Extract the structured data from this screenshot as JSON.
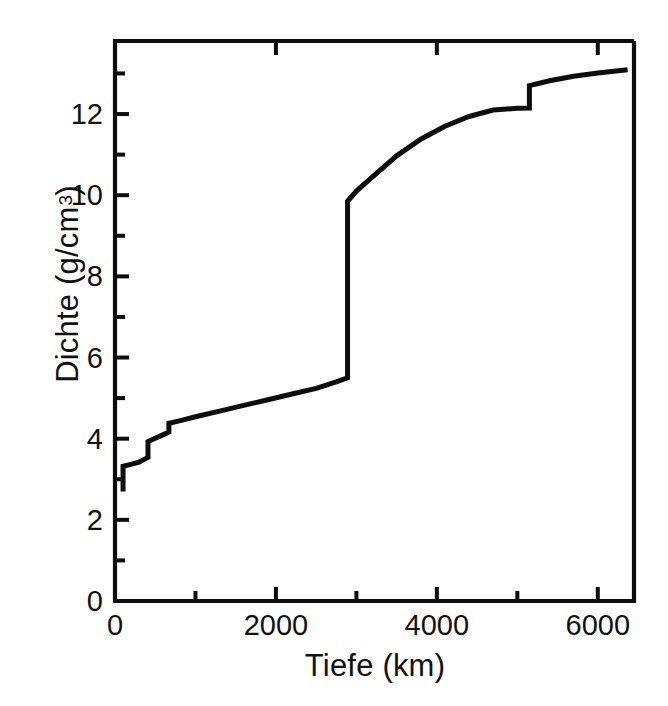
{
  "figure": {
    "title": "",
    "xlabel": "Tiefe (km)",
    "ylabel_main": "Dichte (g/cm",
    "ylabel_exponent": "3",
    "ylabel_close": ")",
    "line_color": "#0d0d0d",
    "axis_color": "#0d0d0d",
    "background": "#ffffff"
  },
  "ticks": {
    "x_major_labels": [
      "0",
      "2000",
      "4000",
      "6000"
    ],
    "x_major_values": [
      0,
      2000,
      4000,
      6000
    ],
    "x_minor_values": [
      1000,
      3000,
      5000
    ],
    "y_major_labels": [
      "0",
      "2",
      "4",
      "6",
      "8",
      "10",
      "12"
    ],
    "y_major_values": [
      0,
      2,
      4,
      6,
      8,
      10,
      12
    ],
    "y_minor_values": [
      1,
      3,
      5,
      7,
      9,
      11,
      13
    ]
  },
  "chart_data": {
    "type": "line",
    "title": "",
    "xlabel": "Tiefe (km)",
    "ylabel": "Dichte (g/cm^3)",
    "xlim": [
      0,
      6450
    ],
    "ylim": [
      0,
      13.8
    ],
    "grid": false,
    "legend": "none",
    "series": [
      {
        "name": "Dichte",
        "x": [
          100,
          100,
          160,
          300,
          410,
          410,
          500,
          600,
          670,
          670,
          800,
          1000,
          1300,
          1600,
          1900,
          2200,
          2500,
          2750,
          2890,
          2890,
          3000,
          3200,
          3500,
          3800,
          4100,
          4400,
          4700,
          5000,
          5150,
          5150,
          5400,
          5700,
          6000,
          6371
        ],
        "y": [
          2.7,
          3.32,
          3.35,
          3.42,
          3.54,
          3.93,
          4.01,
          4.1,
          4.16,
          4.38,
          4.44,
          4.54,
          4.68,
          4.82,
          4.96,
          5.1,
          5.24,
          5.4,
          5.5,
          9.85,
          10.1,
          10.45,
          10.97,
          11.38,
          11.7,
          11.94,
          12.1,
          12.14,
          12.15,
          12.7,
          12.82,
          12.93,
          13.01,
          13.09
        ]
      }
    ],
    "annotations": [
      {
        "label": "Kruste-Mantel-Sprung",
        "x": 100,
        "y_from": 2.7,
        "y_to": 3.32
      },
      {
        "label": "410-km-Diskontinuitaet",
        "x": 410,
        "y_from": 3.54,
        "y_to": 3.93
      },
      {
        "label": "670-km-Diskontinuitaet",
        "x": 670,
        "y_from": 4.16,
        "y_to": 4.38
      },
      {
        "label": "Kern-Mantel-Grenze",
        "x": 2890,
        "y_from": 5.5,
        "y_to": 9.85
      },
      {
        "label": "Innerer-Kern-Grenze",
        "x": 5150,
        "y_from": 12.15,
        "y_to": 12.7
      }
    ]
  }
}
